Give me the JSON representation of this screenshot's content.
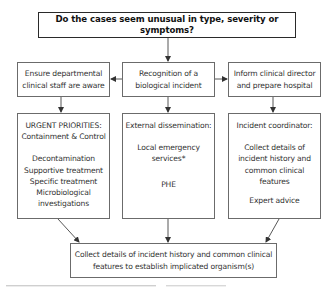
{
  "title": "Do the cases seem unusual in type, severity or symptoms?",
  "row2": {
    "left": [
      "Ensure departmental",
      "clinical staff are aware"
    ],
    "center": [
      "Recognition of a",
      "biological incident"
    ],
    "right": [
      "Inform clinical director",
      "and prepare hospital"
    ]
  },
  "row3": {
    "left": {
      "heading": [
        "URGENT PRIORITIES:",
        "Containment & Control"
      ],
      "items": [
        "Decontamination",
        "Supportive treatment",
        "Specific treatment",
        "Microbiological",
        "investigations"
      ]
    },
    "center": {
      "heading": "External dissemination:",
      "items": [
        "Local emergency",
        "services*"
      ],
      "extra": "PHE"
    },
    "right": {
      "heading": "Incident coordinator:",
      "items": [
        "Collect details of",
        "incident history and",
        "common clinical",
        "features"
      ],
      "extra": "Expert advice"
    }
  },
  "bottom": [
    "Collect details of incident history and common clinical",
    "features to establish implicated organism(s)"
  ],
  "colors": {
    "border": "#6b6b6b",
    "top_border": "#2a2a2a",
    "text": "#333333",
    "arrow": "#333333"
  }
}
